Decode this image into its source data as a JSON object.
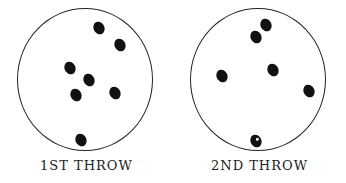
{
  "panels": [
    {
      "label": "1ST THROW",
      "ovals": [
        {
          "x": 99,
          "y": 28
        },
        {
          "x": 120,
          "y": 45
        },
        {
          "x": 70,
          "y": 68
        },
        {
          "x": 89,
          "y": 80
        },
        {
          "x": 76,
          "y": 95
        },
        {
          "x": 115,
          "y": 93
        },
        {
          "x": 81,
          "y": 140
        }
      ]
    },
    {
      "label": "2ND THROW",
      "ovals": [
        {
          "x": 93,
          "y": 25
        },
        {
          "x": 83,
          "y": 37
        },
        {
          "x": 49,
          "y": 76
        },
        {
          "x": 100,
          "y": 70
        },
        {
          "x": 136,
          "y": 91
        },
        {
          "x": 83,
          "y": 141,
          "marked": true
        }
      ]
    }
  ]
}
